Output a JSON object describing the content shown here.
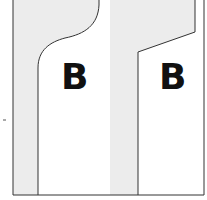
{
  "diagram": {
    "panels": [
      {
        "id": "left",
        "label": "B",
        "shape": "curved-top"
      },
      {
        "id": "right",
        "label": "B",
        "shape": "slanted-top"
      }
    ],
    "colors": {
      "background_gray": "#ececec",
      "white_region": "#ffffff",
      "outline": "#333333",
      "label": "#111111"
    },
    "tick_mark": "-"
  }
}
